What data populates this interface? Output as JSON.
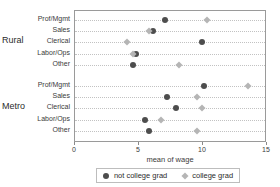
{
  "chart_data": {
    "type": "scatter",
    "title": "",
    "xlabel": "mean of wage",
    "ylabel": "",
    "xlim": [
      0,
      15
    ],
    "xticks": [
      0,
      5,
      10,
      15
    ],
    "xtick_labels": [
      "0",
      "5",
      "10",
      "15"
    ],
    "grid": "horizontal-dotted-per-row",
    "legend_position": "bottom",
    "groups": [
      {
        "name": "Rural",
        "categories": [
          "Prof/Mgmt",
          "Sales",
          "Clerical",
          "Labor/Ops",
          "Other"
        ],
        "series": [
          {
            "name": "not college grad",
            "values": [
              7.0,
              6.1,
              9.9,
              4.8,
              4.5
            ]
          },
          {
            "name": "college grad",
            "values": [
              10.3,
              5.8,
              4.1,
              4.5,
              8.1
            ]
          }
        ]
      },
      {
        "name": "Metro",
        "categories": [
          "Prof/Mgmt",
          "Sales",
          "Clerical",
          "Labor/Ops",
          "Other"
        ],
        "series": [
          {
            "name": "not college grad",
            "values": [
              10.1,
              7.2,
              7.9,
              5.5,
              5.8
            ]
          },
          {
            "name": "college grad",
            "values": [
              13.5,
              9.5,
              9.9,
              6.7,
              9.5
            ]
          }
        ]
      }
    ],
    "series_styles": [
      {
        "name": "not college grad",
        "marker": "circle",
        "color": "#4d4d4d"
      },
      {
        "name": "college grad",
        "marker": "diamond",
        "color": "#b5b5b5"
      }
    ]
  },
  "legend": {
    "entries": [
      {
        "label": "not college grad"
      },
      {
        "label": "college grad"
      }
    ]
  }
}
